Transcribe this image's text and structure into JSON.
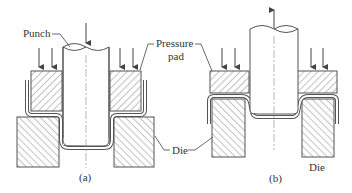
{
  "diagram": {
    "type": "sheet-metal forming (punch / pressure pad / die)",
    "colors": {
      "line": "#555555",
      "hatch": "#777777",
      "text": "#333333",
      "background": "#ffffff"
    },
    "labels": {
      "punch": "Punch",
      "pressure_pad_line1": "Pressure",
      "pressure_pad_line2": "pad",
      "die_shared": "Die",
      "die_b": "Die",
      "caption_a": "(a)",
      "caption_b": "(b)"
    },
    "panels": [
      {
        "id": "a",
        "caption": "(a)",
        "punch_direction": "down",
        "pad_force_arrows": 4
      },
      {
        "id": "b",
        "caption": "(b)",
        "punch_direction": "up",
        "pad_force_arrows": 4
      }
    ]
  }
}
